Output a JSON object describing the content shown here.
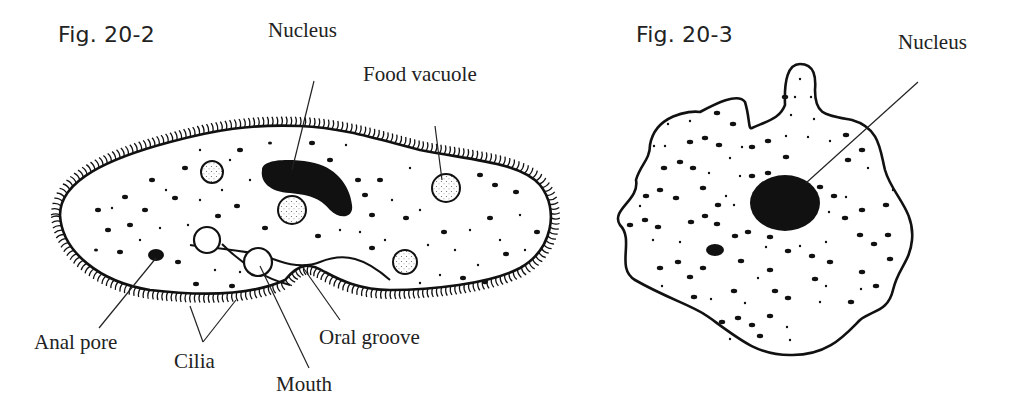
{
  "figures": [
    {
      "id": "fig-20-2",
      "title": "Fig. 20-2",
      "subject": "paramecium",
      "labels": {
        "nucleus": "Nucleus",
        "food_vacuole": "Food vacuole",
        "anal_pore": "Anal pore",
        "cilia": "Cilia",
        "mouth": "Mouth",
        "oral_groove": "Oral groove"
      }
    },
    {
      "id": "fig-20-3",
      "title": "Fig. 20-3",
      "subject": "amoeba",
      "labels": {
        "nucleus": "Nucleus"
      }
    }
  ],
  "colors": {
    "ink": "#111111",
    "background": "#ffffff"
  }
}
